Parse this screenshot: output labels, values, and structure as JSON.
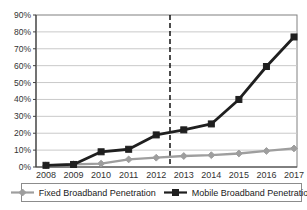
{
  "chart_data": {
    "type": "line",
    "title": "",
    "xlabel": "",
    "ylabel": "",
    "categories": [
      "2008",
      "2009",
      "2010",
      "2011",
      "2012",
      "2013",
      "2014",
      "2015",
      "2016",
      "2017"
    ],
    "series": [
      {
        "name": "Fixed Broadband Penetration",
        "values": [
          1,
          1.5,
          2,
          4.5,
          5.5,
          6.5,
          7,
          8,
          9.5,
          11
        ],
        "color": "#9e9e9e",
        "marker": "diamond"
      },
      {
        "name": "Mobile Broadband Penetration",
        "values": [
          1,
          1.5,
          9,
          10.5,
          19,
          22,
          25.5,
          40,
          59.5,
          77
        ],
        "color": "#1f1f1f",
        "marker": "square"
      }
    ],
    "ylim": [
      0,
      90
    ],
    "ytick_step": 10,
    "ytick_suffix": "%",
    "grid": "horizontal",
    "legend_position": "bottom",
    "annotations": [
      {
        "type": "vline",
        "between": [
          "2012",
          "2013"
        ],
        "style": "dashed",
        "color": "#000000"
      }
    ]
  },
  "colors": {
    "background": "#ffffff",
    "gridline": "#c9c9c9",
    "plot_border": "#808080",
    "axis": "#404040",
    "tick_text": "#333333",
    "legend_border": "#8c8c8c"
  }
}
